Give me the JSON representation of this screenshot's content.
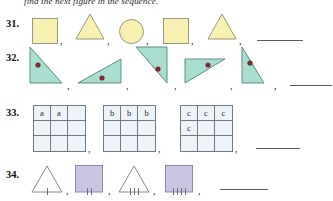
{
  "instruction": "find the next figure in the sequence.",
  "colors": {
    "yellow_fill": "#f7f0b0",
    "yellow_stroke": "#9a9a7a",
    "green_fill": "#a8ddd0",
    "green_stroke": "#5d8f86",
    "dot": "#7a2b2b",
    "grid_fill": "#eef3f8",
    "grid_stroke": "#6e7a86",
    "purple_fill": "#c9c6e4",
    "purple_stroke": "#8d8aa8",
    "white_fill": "#ffffff",
    "white_stroke": "#8a8a8a",
    "blank_line": "#5b5b66"
  },
  "problems": [
    {
      "number": "31.",
      "items": [
        {
          "shape": "square",
          "fill": "yellow",
          "separator": ","
        },
        {
          "shape": "triangle",
          "fill": "yellow",
          "separator": ","
        },
        {
          "shape": "circle",
          "fill": "yellow",
          "separator": ","
        },
        {
          "shape": "square",
          "fill": "yellow",
          "separator": ","
        },
        {
          "shape": "triangle",
          "fill": "yellow",
          "separator": ","
        }
      ],
      "answer_blank": true
    },
    {
      "number": "32.",
      "items": [
        {
          "shape": "right-triangle",
          "fill": "green",
          "orientation": "right-angle-top-left",
          "dot": true,
          "separator": ","
        },
        {
          "shape": "right-triangle",
          "fill": "green",
          "orientation": "right-angle-bottom-right",
          "dot": true,
          "separator": ","
        },
        {
          "shape": "right-triangle",
          "fill": "green",
          "orientation": "right-angle-top-right",
          "dot": true,
          "separator": ","
        },
        {
          "shape": "right-triangle",
          "fill": "green",
          "orientation": "right-angle-top-left-flat",
          "dot": true,
          "separator": ","
        },
        {
          "shape": "right-triangle",
          "fill": "green",
          "orientation": "right-angle-bottom-left",
          "dot": true,
          "separator": ","
        }
      ],
      "answer_blank": true
    },
    {
      "number": "33.",
      "items": [
        {
          "shape": "grid3x3",
          "cells": [
            "a",
            "a",
            "",
            "",
            "",
            "",
            "",
            "",
            ""
          ],
          "separator": ","
        },
        {
          "shape": "grid3x3",
          "cells": [
            "b",
            "b",
            "b",
            "",
            "",
            "",
            "",
            "",
            ""
          ],
          "separator": ","
        },
        {
          "shape": "grid3x3",
          "cells": [
            "c",
            "c",
            "c",
            "c",
            "",
            "",
            "",
            "",
            ""
          ],
          "separator": ","
        }
      ],
      "answer_blank": true
    },
    {
      "number": "34.",
      "items": [
        {
          "shape": "triangle",
          "fill": "white",
          "ticks": 1,
          "separator": ","
        },
        {
          "shape": "square",
          "fill": "purple",
          "ticks": 2,
          "separator": ","
        },
        {
          "shape": "triangle",
          "fill": "white",
          "ticks": 3,
          "separator": ","
        },
        {
          "shape": "square",
          "fill": "purple",
          "ticks": 4,
          "separator": ","
        }
      ],
      "answer_blank": true
    }
  ]
}
